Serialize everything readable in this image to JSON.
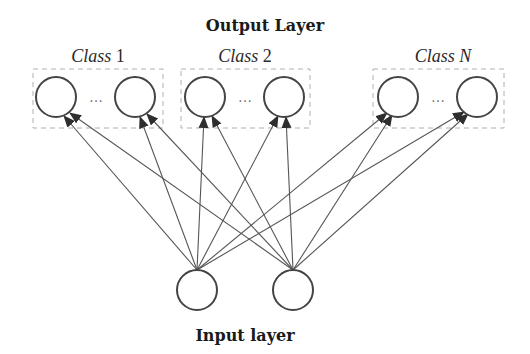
{
  "diagram": {
    "title_output": "Output Layer",
    "title_input": "Input layer",
    "ellipsis": "…",
    "classes": [
      {
        "label_word": "Class",
        "label_index": "1",
        "box": {
          "x": 33,
          "y": 69,
          "w": 130,
          "h": 59
        },
        "nodes": [
          {
            "cx": 56,
            "cy": 97
          },
          {
            "cx": 135,
            "cy": 97
          }
        ]
      },
      {
        "label_word": "Class",
        "label_index": "2",
        "box": {
          "x": 181,
          "y": 69,
          "w": 129,
          "h": 59
        },
        "nodes": [
          {
            "cx": 205,
            "cy": 97
          },
          {
            "cx": 284,
            "cy": 97
          }
        ]
      },
      {
        "label_word": "Class",
        "label_index": "N",
        "box": {
          "x": 373,
          "y": 69,
          "w": 131,
          "h": 59
        },
        "nodes": [
          {
            "cx": 398,
            "cy": 97
          },
          {
            "cx": 477,
            "cy": 97
          }
        ]
      }
    ],
    "input_nodes": [
      {
        "cx": 197,
        "cy": 290
      },
      {
        "cx": 293,
        "cy": 290
      }
    ],
    "node_radius": 20,
    "connectivity": "fully-connected input to output with arrowheads at outputs",
    "colors": {
      "node_stroke": "#444444",
      "edge": "#555555",
      "box_dash": "#b0b0b0",
      "text": "#1a1a1a"
    }
  }
}
